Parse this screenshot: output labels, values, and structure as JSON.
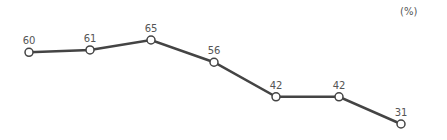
{
  "chart_data": {
    "type": "line",
    "title": "",
    "xlabel": "",
    "ylabel": "",
    "unit_label": "(%)",
    "categories": [
      "1",
      "2",
      "3",
      "4",
      "5",
      "6",
      "7"
    ],
    "series": [
      {
        "name": "",
        "values": [
          60,
          61,
          65,
          56,
          42,
          42,
          31
        ]
      }
    ],
    "labels": [
      "60",
      "61",
      "65",
      "56",
      "42",
      "42",
      "31"
    ],
    "grid": false,
    "line_color": "#444444",
    "marker_fill": "#ffffff"
  }
}
